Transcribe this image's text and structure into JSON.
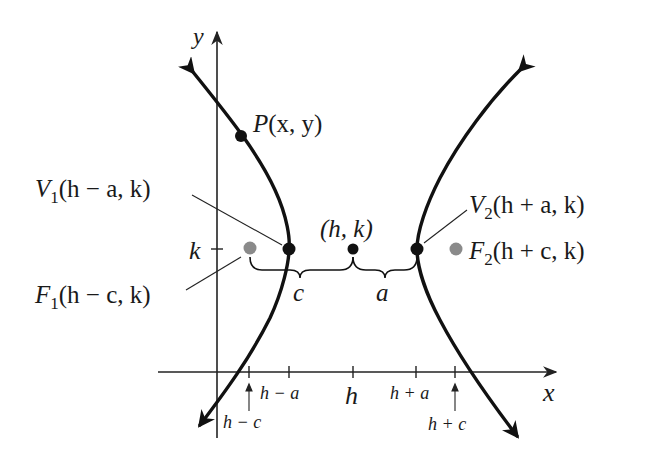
{
  "diagram": {
    "axes": {
      "x_label": "x",
      "y_label": "y",
      "y_tick_label": "k"
    },
    "x_ticks": [
      {
        "label": "h − c",
        "position": "below-with-arrow"
      },
      {
        "label": "h − a",
        "position": "below"
      },
      {
        "label": "h",
        "position": "below"
      },
      {
        "label": "h + a",
        "position": "below"
      },
      {
        "label": "h + c",
        "position": "below-with-arrow"
      }
    ],
    "points": {
      "P": {
        "name": "P",
        "coords": "(x, y)"
      },
      "center": {
        "coords": "(h, k)"
      },
      "V1": {
        "name": "V",
        "sub": "1",
        "coords": "(h − a, k)"
      },
      "V2": {
        "name": "V",
        "sub": "2",
        "coords": "(h + a, k)"
      },
      "F1": {
        "name": "F",
        "sub": "1",
        "coords": "(h − c, k)"
      },
      "F2": {
        "name": "F",
        "sub": "2",
        "coords": "(h + c, k)"
      }
    },
    "braces": {
      "c_label": "c",
      "a_label": "a"
    },
    "colors": {
      "curve": "#111111",
      "axis": "#222222",
      "vertex": "#111111",
      "focus": "#8a8a8a"
    }
  }
}
